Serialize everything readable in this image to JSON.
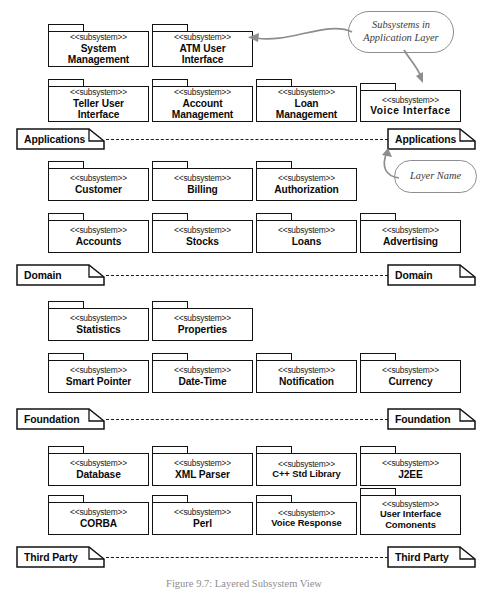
{
  "figure": {
    "caption": "Figure 9.7: Layered Subsystem View",
    "stereotype": "<<subsystem>>"
  },
  "callouts": [
    {
      "id": "subsystems-in-application-layer",
      "line1": "Subsystems in",
      "line2": "Application Layer"
    },
    {
      "id": "layer-name",
      "line1": "Layer Name",
      "line2": ""
    }
  ],
  "layers": [
    {
      "id": "applications",
      "name": "Applications",
      "left_label": "Applications",
      "right_label": "Applications",
      "subsystems": [
        {
          "name_line1": "System",
          "name_line2": "Management"
        },
        {
          "name_line1": "ATM User",
          "name_line2": "Interface"
        },
        {
          "name_line1": "Teller User",
          "name_line2": "Interface"
        },
        {
          "name_line1": "Account",
          "name_line2": "Management"
        },
        {
          "name_line1": "Loan",
          "name_line2": "Management"
        },
        {
          "name_line1": "Voice  Interface",
          "name_line2": ""
        }
      ]
    },
    {
      "id": "domain",
      "name": "Domain",
      "left_label": "Domain",
      "right_label": "Domain",
      "subsystems": [
        {
          "name_line1": "Customer",
          "name_line2": ""
        },
        {
          "name_line1": "Billing",
          "name_line2": ""
        },
        {
          "name_line1": "Authorization",
          "name_line2": ""
        },
        {
          "name_line1": "Accounts",
          "name_line2": ""
        },
        {
          "name_line1": "Stocks",
          "name_line2": ""
        },
        {
          "name_line1": "Loans",
          "name_line2": ""
        },
        {
          "name_line1": "Advertising",
          "name_line2": ""
        }
      ]
    },
    {
      "id": "foundation",
      "name": "Foundation",
      "left_label": "Foundation",
      "right_label": "Foundation",
      "subsystems": [
        {
          "name_line1": "Statistics",
          "name_line2": ""
        },
        {
          "name_line1": "Properties",
          "name_line2": ""
        },
        {
          "name_line1": "Smart Pointer",
          "name_line2": ""
        },
        {
          "name_line1": "Date-Time",
          "name_line2": ""
        },
        {
          "name_line1": "Notification",
          "name_line2": ""
        },
        {
          "name_line1": "Currency",
          "name_line2": ""
        }
      ]
    },
    {
      "id": "third-party",
      "name": "Third Party",
      "left_label": "Third Party",
      "right_label": "Third Party",
      "subsystems": [
        {
          "name_line1": "Database",
          "name_line2": ""
        },
        {
          "name_line1": "XML Parser",
          "name_line2": ""
        },
        {
          "name_line1": "C++ Std Library",
          "name_line2": ""
        },
        {
          "name_line1": "J2EE",
          "name_line2": ""
        },
        {
          "name_line1": "CORBA",
          "name_line2": ""
        },
        {
          "name_line1": "Perl",
          "name_line2": ""
        },
        {
          "name_line1": "Voice Response",
          "name_line2": ""
        },
        {
          "name_line1": "User Interface",
          "name_line2": "Comonents"
        }
      ]
    }
  ],
  "colors": {
    "stroke": "#121212",
    "callout_stroke": "#8d8d8d",
    "background": "#ffffff",
    "caption": "#8e8e8e"
  }
}
